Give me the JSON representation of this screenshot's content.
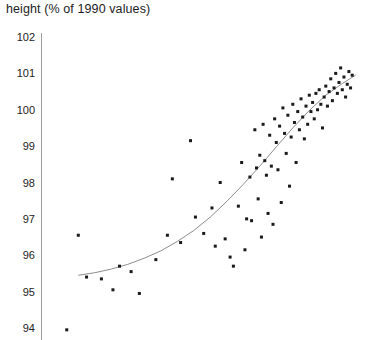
{
  "chart_data": {
    "type": "scatter",
    "title": "height (% of 1990 values)",
    "xlabel": "",
    "ylabel": "height (% of 1990 values)",
    "ylim": [
      93.6,
      102.2
    ],
    "xlim": [
      0,
      100
    ],
    "grid": false,
    "legend": null,
    "yticks": [
      94,
      95,
      96,
      97,
      98,
      99,
      100,
      101,
      102
    ],
    "ytick_labels": [
      "94",
      "95",
      "96",
      "97",
      "98",
      "99",
      "100",
      "101",
      "102"
    ],
    "xticks": [],
    "xtick_labels": [],
    "marker": {
      "shape": "square",
      "size_px": 3,
      "color": "#1a1a1a"
    },
    "fit_curve": {
      "name": "fitted trend",
      "color": "#8c8c8c",
      "width_px": 1,
      "x": [
        11,
        16,
        21,
        26,
        31,
        36,
        41,
        46,
        51,
        56,
        61,
        66,
        71,
        76,
        81,
        86,
        91,
        95
      ],
      "y": [
        95.45,
        95.52,
        95.62,
        95.75,
        95.92,
        96.12,
        96.38,
        96.68,
        97.05,
        97.48,
        97.95,
        98.45,
        98.98,
        99.5,
        99.98,
        100.4,
        100.72,
        100.95
      ]
    },
    "points": [
      {
        "x": 7.5,
        "y": 93.95
      },
      {
        "x": 11.0,
        "y": 96.55
      },
      {
        "x": 13.5,
        "y": 95.4
      },
      {
        "x": 18.0,
        "y": 95.35
      },
      {
        "x": 21.5,
        "y": 95.05
      },
      {
        "x": 23.5,
        "y": 95.7
      },
      {
        "x": 27.0,
        "y": 95.55
      },
      {
        "x": 29.5,
        "y": 94.95
      },
      {
        "x": 34.5,
        "y": 95.88
      },
      {
        "x": 38.0,
        "y": 96.55
      },
      {
        "x": 39.5,
        "y": 98.1
      },
      {
        "x": 42.0,
        "y": 96.35
      },
      {
        "x": 45.0,
        "y": 99.15
      },
      {
        "x": 46.5,
        "y": 97.05
      },
      {
        "x": 49.0,
        "y": 96.6
      },
      {
        "x": 51.5,
        "y": 97.3
      },
      {
        "x": 52.5,
        "y": 96.25
      },
      {
        "x": 54.0,
        "y": 98.0
      },
      {
        "x": 55.5,
        "y": 96.45
      },
      {
        "x": 57.0,
        "y": 95.95
      },
      {
        "x": 58.0,
        "y": 95.7
      },
      {
        "x": 59.5,
        "y": 97.35
      },
      {
        "x": 60.5,
        "y": 98.55
      },
      {
        "x": 61.5,
        "y": 96.15
      },
      {
        "x": 62.0,
        "y": 97.0
      },
      {
        "x": 63.0,
        "y": 98.15
      },
      {
        "x": 63.5,
        "y": 96.95
      },
      {
        "x": 64.5,
        "y": 99.45
      },
      {
        "x": 65.0,
        "y": 98.4
      },
      {
        "x": 65.5,
        "y": 97.55
      },
      {
        "x": 66.0,
        "y": 98.75
      },
      {
        "x": 66.5,
        "y": 96.5
      },
      {
        "x": 67.0,
        "y": 99.6
      },
      {
        "x": 67.5,
        "y": 98.6
      },
      {
        "x": 68.0,
        "y": 98.2
      },
      {
        "x": 68.5,
        "y": 97.15
      },
      {
        "x": 69.0,
        "y": 99.3
      },
      {
        "x": 69.5,
        "y": 98.45
      },
      {
        "x": 70.0,
        "y": 96.85
      },
      {
        "x": 70.5,
        "y": 99.75
      },
      {
        "x": 71.0,
        "y": 99.1
      },
      {
        "x": 71.5,
        "y": 98.35
      },
      {
        "x": 72.0,
        "y": 99.55
      },
      {
        "x": 72.5,
        "y": 97.45
      },
      {
        "x": 73.0,
        "y": 100.05
      },
      {
        "x": 73.5,
        "y": 99.35
      },
      {
        "x": 74.0,
        "y": 98.8
      },
      {
        "x": 74.5,
        "y": 99.85
      },
      {
        "x": 75.0,
        "y": 97.9
      },
      {
        "x": 75.5,
        "y": 99.25
      },
      {
        "x": 76.0,
        "y": 100.15
      },
      {
        "x": 76.5,
        "y": 99.65
      },
      {
        "x": 77.0,
        "y": 98.55
      },
      {
        "x": 77.5,
        "y": 99.95
      },
      {
        "x": 78.0,
        "y": 99.45
      },
      {
        "x": 78.5,
        "y": 100.3
      },
      {
        "x": 79.0,
        "y": 99.8
      },
      {
        "x": 79.5,
        "y": 99.2
      },
      {
        "x": 80.0,
        "y": 100.1
      },
      {
        "x": 80.5,
        "y": 99.6
      },
      {
        "x": 81.0,
        "y": 100.4
      },
      {
        "x": 81.5,
        "y": 99.95
      },
      {
        "x": 82.0,
        "y": 100.2
      },
      {
        "x": 82.5,
        "y": 99.75
      },
      {
        "x": 83.0,
        "y": 100.45
      },
      {
        "x": 83.5,
        "y": 100.0
      },
      {
        "x": 84.0,
        "y": 100.55
      },
      {
        "x": 84.5,
        "y": 100.15
      },
      {
        "x": 85.0,
        "y": 99.5
      },
      {
        "x": 85.5,
        "y": 100.35
      },
      {
        "x": 86.0,
        "y": 100.65
      },
      {
        "x": 86.5,
        "y": 100.1
      },
      {
        "x": 87.0,
        "y": 100.5
      },
      {
        "x": 87.5,
        "y": 100.85
      },
      {
        "x": 88.0,
        "y": 100.25
      },
      {
        "x": 88.5,
        "y": 100.6
      },
      {
        "x": 89.0,
        "y": 101.0
      },
      {
        "x": 89.5,
        "y": 100.45
      },
      {
        "x": 90.0,
        "y": 100.75
      },
      {
        "x": 90.5,
        "y": 101.15
      },
      {
        "x": 91.0,
        "y": 100.55
      },
      {
        "x": 91.5,
        "y": 100.9
      },
      {
        "x": 92.0,
        "y": 100.35
      },
      {
        "x": 92.5,
        "y": 100.7
      },
      {
        "x": 93.0,
        "y": 101.05
      },
      {
        "x": 93.5,
        "y": 100.6
      },
      {
        "x": 94.0,
        "y": 100.95
      }
    ]
  }
}
